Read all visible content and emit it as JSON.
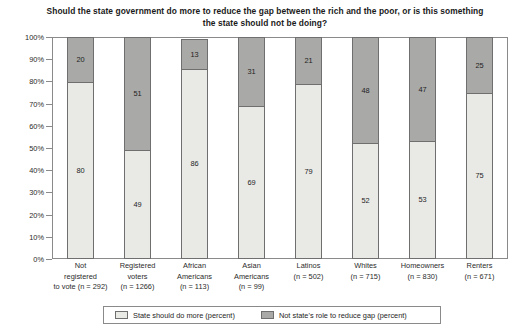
{
  "chart_data": {
    "type": "bar",
    "subtype": "stacked-bar-100",
    "title": "Should the state government do more to reduce the gap between the rich and the poor, or is this something the state should not be doing?",
    "xlabel": "",
    "ylabel": "",
    "ylim": [
      0,
      100
    ],
    "grid": false,
    "legend_position": "bottom",
    "categories": [
      "Not registered to vote (n = 292)",
      "Registered voters (n = 1266)",
      "African Americans (n = 113)",
      "Asian Americans (n = 99)",
      "Latinos (n = 502)",
      "Whites (n = 715)",
      "Homeowners (n = 830)",
      "Renters (n = 671)"
    ],
    "category_lines": [
      [
        "Not",
        "registered",
        "to vote (n = 292)"
      ],
      [
        "Registered",
        "voters",
        "(n = 1266)"
      ],
      [
        "African",
        "Americans",
        "(n = 113)"
      ],
      [
        "Asian",
        "Americans",
        "(n = 99)"
      ],
      [
        "Latinos",
        "(n = 502)"
      ],
      [
        "Whites",
        "(n = 715)"
      ],
      [
        "Homeowners",
        "(n = 830)"
      ],
      [
        "Renters",
        "(n = 671)"
      ]
    ],
    "series": [
      {
        "name": "State should do more (percent)",
        "color": "#e9e9e6",
        "values": [
          80,
          49,
          86,
          69,
          79,
          52,
          53,
          75
        ]
      },
      {
        "name": "Not state's role to reduce gap (percent)",
        "color": "#a9a9a7",
        "values": [
          20,
          51,
          13,
          31,
          21,
          48,
          47,
          25
        ]
      }
    ],
    "ytick_labels": [
      "100%",
      "90%",
      "80%",
      "70%",
      "60%",
      "50%",
      "40%",
      "30%",
      "20%",
      "10%",
      "0%"
    ],
    "ytick_values": [
      100,
      90,
      80,
      70,
      60,
      50,
      40,
      30,
      20,
      10,
      0
    ]
  },
  "legend": {
    "items": [
      {
        "label": "State should do more (percent)",
        "color": "#e9e9e6"
      },
      {
        "label": "Not state's role to reduce gap (percent)",
        "color": "#a9a9a7"
      }
    ]
  },
  "colors": {
    "series_light": "#e9e9e6",
    "series_dark": "#a9a9a7",
    "axis": "#8a8a8a",
    "bar_outline": "#6f6f6f",
    "text": "#1e1e1e",
    "background": "#ffffff"
  }
}
